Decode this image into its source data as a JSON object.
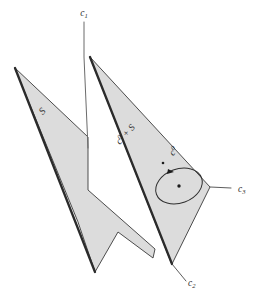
{
  "figure": {
    "background_color": "#ffffff",
    "plane_fill_color": "#dcdcdc",
    "edge_color": "#2b2b2b",
    "axis_color": "#6b6b6b"
  },
  "axes": [
    {
      "id": "c1",
      "name": "axis-label-c1",
      "base": "c",
      "subscript": "1",
      "superscript": "",
      "x": 84,
      "y": 14,
      "position": "top"
    },
    {
      "id": "c2",
      "name": "axis-label-c2",
      "base": "c",
      "subscript": "2",
      "superscript": "",
      "x": 188,
      "y": 284,
      "position": "bottom-right"
    },
    {
      "id": "c3",
      "name": "axis-label-c3",
      "base": "c",
      "subscript": "3",
      "superscript": "",
      "x": 238,
      "y": 190,
      "position": "right"
    }
  ],
  "surface_labels": [
    {
      "id": "S",
      "name": "surface-label-s",
      "base": "S",
      "subscript": "",
      "superscript": "",
      "x": 43,
      "y": 112,
      "rotation": -46,
      "surface": "left-plane"
    },
    {
      "id": "c0+S",
      "name": "surface-label-c0-plus-s",
      "base": "c",
      "superscript": "0",
      "suffix": " + S",
      "x": 126,
      "y": 135,
      "rotation": -48,
      "surface": "right-plane"
    }
  ],
  "loop": {
    "name": "oriented-loop",
    "label": {
      "name": "loop-label-c0",
      "base": "c",
      "superscript": "0",
      "x": 174,
      "y": 152,
      "rotation": -48
    },
    "center_x": 179,
    "center_y": 186,
    "radius_x": 24,
    "radius_y": 17,
    "rotation": -20,
    "direction": "counterclockwise",
    "has_center_dot": true,
    "has_arrow_head": true
  },
  "geometry": {
    "left_plane_points": "15,68 88,137 88,190 155,249 153,258 118,232 95,272 78,222",
    "right_plane_points": "90,57 210,187 172,264",
    "right_plane_thick_edge": "90,57 172,264",
    "left_plane_thick_edge": "15,68 95,272",
    "axis_c1_line": "84,22 84,57 88,148",
    "axis_c2_leader": "172,264 186,281",
    "axis_c3_leader": "210,187 231,188"
  }
}
